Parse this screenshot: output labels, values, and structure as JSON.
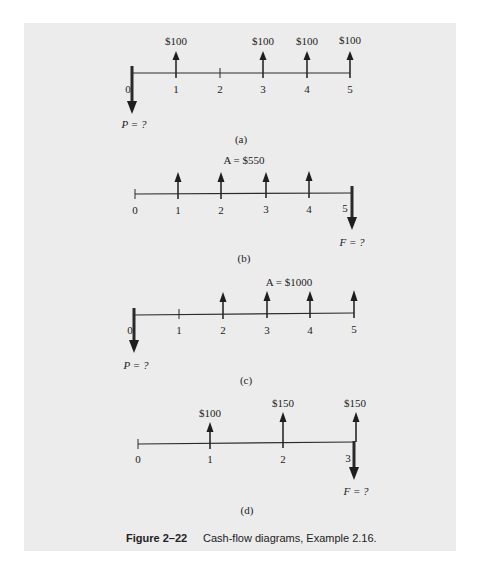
{
  "figure": {
    "number_label": "Figure 2–22",
    "caption": "Cash-flow diagrams, Example 2.16."
  },
  "diagrams": [
    {
      "id": "a",
      "label": "(a)",
      "periods": [
        "0",
        "1",
        "2",
        "3",
        "4",
        "5"
      ],
      "flows": [
        {
          "period": 0,
          "direction": "down",
          "label": "P = ?"
        },
        {
          "period": 1,
          "direction": "up",
          "label": "$100"
        },
        {
          "period": 3,
          "direction": "up",
          "label": "$100"
        },
        {
          "period": 4,
          "direction": "up",
          "label": "$100"
        },
        {
          "period": 5,
          "direction": "up",
          "label": "$100"
        }
      ]
    },
    {
      "id": "b",
      "label": "(b)",
      "annuity_label": "A = $550",
      "periods": [
        "0",
        "1",
        "2",
        "3",
        "4",
        "5"
      ],
      "flows": [
        {
          "period": 1,
          "direction": "up"
        },
        {
          "period": 2,
          "direction": "up"
        },
        {
          "period": 3,
          "direction": "up"
        },
        {
          "period": 4,
          "direction": "up"
        },
        {
          "period": 5,
          "direction": "down",
          "label": "F = ?"
        }
      ]
    },
    {
      "id": "c",
      "label": "(c)",
      "annuity_label": "A = $1000",
      "periods": [
        "0",
        "1",
        "2",
        "3",
        "4",
        "5"
      ],
      "flows": [
        {
          "period": 0,
          "direction": "down",
          "label": "P = ?"
        },
        {
          "period": 2,
          "direction": "up"
        },
        {
          "period": 3,
          "direction": "up"
        },
        {
          "period": 4,
          "direction": "up"
        },
        {
          "period": 5,
          "direction": "up"
        }
      ]
    },
    {
      "id": "d",
      "label": "(d)",
      "periods": [
        "0",
        "1",
        "2",
        "3"
      ],
      "flows": [
        {
          "period": 1,
          "direction": "up",
          "label": "$100"
        },
        {
          "period": 2,
          "direction": "up",
          "label": "$150"
        },
        {
          "period": 3,
          "direction": "up",
          "label": "$150"
        },
        {
          "period": 3,
          "direction": "down",
          "label": "F = ?"
        }
      ]
    }
  ],
  "colors": {
    "panel": "#ececec",
    "ink": "#2a2a2a"
  }
}
